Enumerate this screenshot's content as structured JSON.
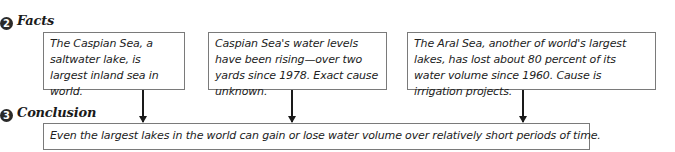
{
  "facts_section": {
    "number": "2",
    "heading": "Facts",
    "items": [
      {
        "text": "The Caspian Sea, a saltwater lake, is largest inland sea in world."
      },
      {
        "text": "Caspian Sea's water levels have been rising—over two yards since 1978. Exact cause unknown."
      },
      {
        "text": "The Aral Sea, another of world's largest lakes, has lost about 80 percent of its water volume since 1960. Cause is irrigation projects."
      }
    ]
  },
  "conclusion_section": {
    "number": "3",
    "heading": "Conclusion",
    "text": "Even the largest lakes in the world can gain or lose water volume over relatively short periods of time."
  },
  "colors": {
    "badge": "#2a2a2a",
    "border": "#7a7a7a",
    "arrow": "#1a1a1a"
  }
}
